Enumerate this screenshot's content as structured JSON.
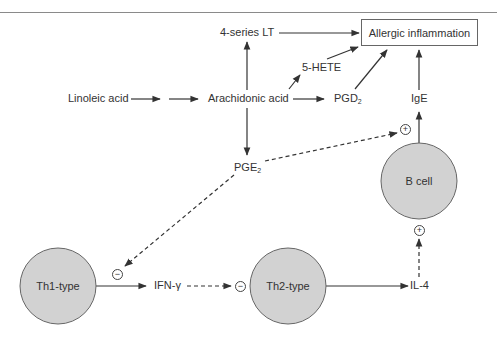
{
  "diagram": {
    "nodes": {
      "linoleic_acid": "Linoleic acid",
      "arachidonic_acid": "Arachidonic acid",
      "lt_4series": "4-series LT",
      "hete_5": "5-HETE",
      "pgd2": {
        "base": "PGD",
        "sub": "2"
      },
      "pge2": {
        "base": "PGE",
        "sub": "2"
      },
      "ige": "IgE",
      "allergic_inflammation": "Allergic inflammation",
      "b_cell": "B cell",
      "th1": "Th1-type",
      "th2": "Th2-type",
      "ifn_gamma": "IFN-γ",
      "il4": "IL-4"
    },
    "signs": {
      "plus": "+",
      "minus": "−"
    },
    "colors": {
      "cell_fill": "#d2d2d2",
      "cell_stroke": "#666666",
      "line": "#333333",
      "rule": "#8a8a8a"
    }
  }
}
